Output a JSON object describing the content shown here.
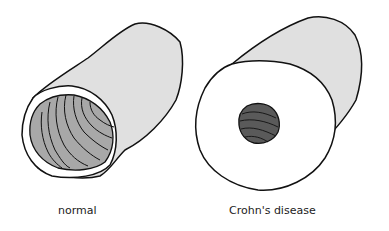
{
  "diagram": {
    "type": "anatomical-illustration",
    "panels": [
      {
        "id": "normal",
        "label": "normal",
        "description": "Bowel tube with thin wall and wide lumen showing folded mucosa"
      },
      {
        "id": "crohns",
        "label": "Crohn's disease",
        "description": "Bowel tube with greatly thickened wall and narrow lumen"
      }
    ],
    "colors": {
      "outer_wall": "#e0e0e0",
      "wall_face": "#ffffff",
      "lumen_normal": "#a8a8a8",
      "lumen_crohns": "#5a5a5a",
      "outline": "#111111"
    }
  }
}
